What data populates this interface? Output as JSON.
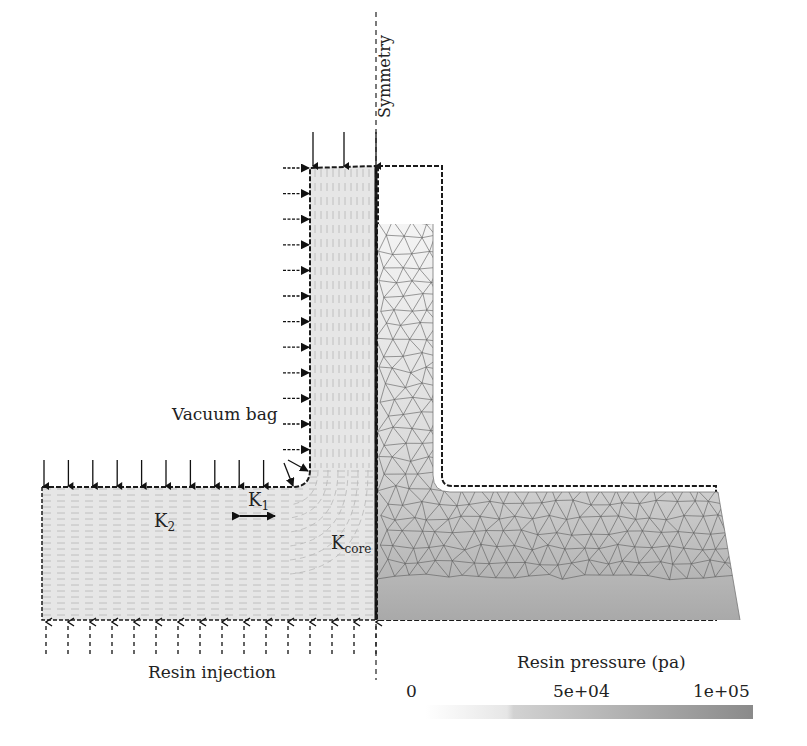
{
  "labels": {
    "symmetry": "Symmetry",
    "vacuum_bag": "Vacuum bag",
    "resin_injection": "Resin injection",
    "k1": "K",
    "k1_sub": "1",
    "k2": "K",
    "k2_sub": "2",
    "kcore": "K",
    "kcore_sub": "core"
  },
  "colorbar": {
    "title": "Resin pressure (pa)",
    "ticks": [
      "0",
      "5e+04",
      "1e+05"
    ],
    "min": 0,
    "max": 100000,
    "color_low": "#ffffff",
    "color_high": "#8a8a8a"
  },
  "panels": {
    "left": "Permeability regions (fibre orientation)",
    "right": "Mesh with resin pressure field"
  },
  "colors": {
    "preform_fill": "#e4e4e4",
    "outline": "#1a1a1a",
    "mesh_line": "#555555"
  }
}
